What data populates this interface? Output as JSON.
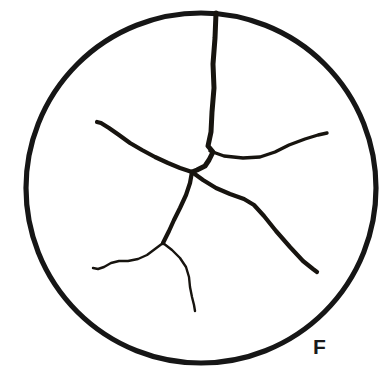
{
  "figure": {
    "panel_label": "F",
    "label_position": {
      "x": 313,
      "y": 336
    },
    "background_color": "#ffffff",
    "ink_color": "#17140f",
    "canvas": {
      "width": 392,
      "height": 380
    }
  },
  "specimen": {
    "shape": "circle",
    "center_x": 201,
    "center_y": 188,
    "radius": 175,
    "stroke_color": "#161616",
    "stroke_width": 5.2
  },
  "crack_network": {
    "description": "radiating fracture pattern within circular specimen",
    "junctions": [
      {
        "name": "main-junction",
        "x": 192,
        "y": 172
      },
      {
        "name": "right-branch-junction",
        "x": 213,
        "y": 150
      },
      {
        "name": "lower-fork",
        "x": 163,
        "y": 243
      }
    ],
    "branches": [
      {
        "name": "vertical-crack",
        "weight": "primary",
        "from": "circle-top",
        "to": "main-junction",
        "path": "M 216 13 L 215 38 L 213 64 L 214 88 L 212 112 L 211 132 L 208 146 L 213 152 L 209 160 L 205 166 L 197 170 L 192 172"
      },
      {
        "name": "right-branch",
        "weight": "medium",
        "from": "right-branch-junction",
        "to": "right-tip",
        "path": "M 210 151 L 224 156 L 243 158 L 260 157 L 275 152 L 289 145 L 305 139 L 318 135 L 327 133"
      },
      {
        "name": "left-branch",
        "weight": "major",
        "from": "main-junction",
        "to": "left-tip",
        "path": "M 192 172 L 180 168 L 168 163 L 155 157 L 142 150 L 130 143 L 119 135 L 109 128 L 101 123 L 97 122"
      },
      {
        "name": "lower-right-branch",
        "weight": "major",
        "from": "main-junction",
        "to": "lower-right-tip",
        "path": "M 192 172 L 203 180 L 216 188 L 230 194 L 244 199 L 254 205 L 264 216 L 276 231 L 290 247 L 303 261 L 313 269 L 317 272"
      },
      {
        "name": "lower-left-branch",
        "weight": "major",
        "from": "main-junction",
        "to": "lower-fork",
        "path": "M 192 172 L 190 183 L 186 195 L 180 208 L 174 220 L 169 231 L 165 239 L 163 243"
      },
      {
        "name": "fork-left-tail",
        "weight": "minor",
        "from": "lower-fork",
        "to": "left-wisp-tip",
        "path": "M 163 243 L 155 249 L 147 255 L 138 259 L 128 261 L 119 261 L 111 263 L 104 267 L 98 269 L 93 268"
      },
      {
        "name": "fork-right-tail",
        "weight": "minor",
        "from": "lower-fork",
        "to": "lower-wisp-tip",
        "path": "M 163 243 L 172 250 L 180 258 L 186 267 L 189 277 L 190 287 L 192 297 L 194 305 L 195 311"
      }
    ]
  }
}
